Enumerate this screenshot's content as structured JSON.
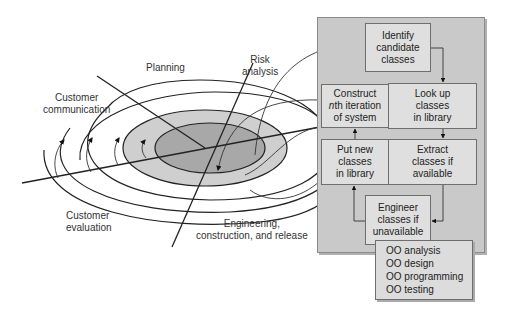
{
  "spiral": {
    "labels": {
      "planning": "Planning",
      "risk_analysis": [
        "Risk",
        "analysis"
      ],
      "customer_communication": [
        "Customer",
        "communication"
      ],
      "customer_evaluation": [
        "Customer",
        "evaluation"
      ],
      "engineering": [
        "Engineering,",
        "construction, and release"
      ]
    },
    "colors": {
      "inner_core": "#a8a8a8",
      "second_ring": "#cfcfcf",
      "outer_rings": "#ffffff",
      "stroke": "#222222"
    }
  },
  "panel": {
    "color": "#c9c9c9",
    "box_color": "#dfdfdf",
    "boxes": {
      "identify": [
        "Identify",
        "candidate",
        "classes"
      ],
      "lookup": [
        "Look up",
        "classes",
        "in library"
      ],
      "extract": [
        "Extract",
        "classes if",
        "available"
      ],
      "engineer": [
        "Engineer",
        "classes if",
        "unavailable"
      ],
      "putnew": [
        "Put new",
        "classes",
        "in library"
      ],
      "construct": [
        "Construct",
        "nth iteration",
        "of system"
      ]
    }
  },
  "oo_box": {
    "items": [
      "OO analysis",
      "OO design",
      "OO programming",
      "OO testing"
    ]
  }
}
